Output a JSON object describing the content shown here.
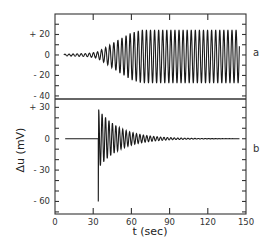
{
  "chart_data": {
    "type": "line",
    "title": "",
    "xlabel": "t (sec)",
    "ylabel": "Δu (mV)",
    "xlim": [
      0,
      150
    ],
    "x_ticks": [
      0,
      30,
      60,
      90,
      120,
      150
    ],
    "x_tick_labels": [
      "0",
      "30",
      "60",
      "90",
      "120",
      "150"
    ],
    "grid": false,
    "legend": null,
    "panels": [
      {
        "label": "a",
        "ylim": [
          -43,
          40
        ],
        "y_ticks": [
          20,
          0,
          -20,
          -40
        ],
        "y_tick_labels": [
          "+ 20",
          "0",
          "- 20",
          "- 40"
        ],
        "minor_tick_step": 10,
        "series": {
          "name": "a",
          "description": "Oscillation with small amplitude from t≈7 s, growing from t≈33 s and saturating at about +25/-28 mV by t≈65 s until t≈145 s",
          "t_start": 7,
          "t_end": 145,
          "period_sec": 3.2,
          "envelope": [
            {
              "t": 7,
              "amp": 0.8
            },
            {
              "t": 25,
              "amp": 1.5
            },
            {
              "t": 33,
              "amp": 3
            },
            {
              "t": 40,
              "amp": 8
            },
            {
              "t": 50,
              "amp": 16
            },
            {
              "t": 60,
              "amp": 23
            },
            {
              "t": 68,
              "amp": 26
            },
            {
              "t": 145,
              "amp": 26
            }
          ],
          "max_value": 25,
          "min_value": -28
        }
      },
      {
        "label": "b",
        "ylim": [
          -72,
          38
        ],
        "y_ticks": [
          30,
          0,
          -30,
          -60
        ],
        "y_tick_labels": [
          "+ 30",
          "0",
          "- 30",
          "- 60"
        ],
        "minor_tick_step": 10,
        "series": {
          "name": "b",
          "description": "Flat at 0 from t≈8 s, sharp negative spike to -60 mV at t≈34 s, then damped oscillation (first peak ≈ +28 mV) decaying to 0 by ≈ t=100 s, flat until t≈145 s",
          "t_start": 8,
          "t_pulse": 34,
          "pulse_min": -60,
          "first_peak": 28,
          "period_sec": 2.7,
          "decay_tau_sec": 17,
          "t_end": 145
        }
      }
    ]
  },
  "labels": {
    "ylabel": "Δu (mV)",
    "xlabel": "t (sec)",
    "panel_a": "a",
    "panel_b": "b"
  }
}
